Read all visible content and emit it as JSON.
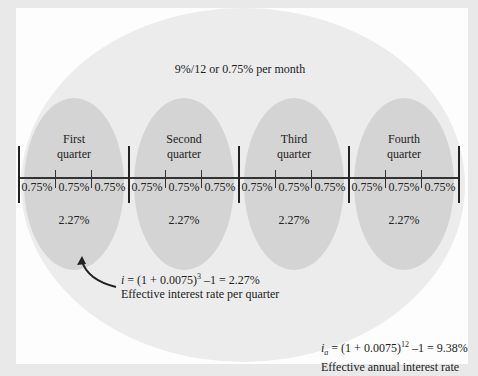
{
  "diagram": {
    "monthly_rate_label": "9%/12 or 0.75% per month",
    "quarters": [
      {
        "label_line1": "First",
        "label_line2": "quarter",
        "months": [
          "0.75%",
          "0.75%",
          "0.75%"
        ],
        "effective": "2.27%"
      },
      {
        "label_line1": "Second",
        "label_line2": "quarter",
        "months": [
          "0.75%",
          "0.75%",
          "0.75%"
        ],
        "effective": "2.27%"
      },
      {
        "label_line1": "Third",
        "label_line2": "quarter",
        "months": [
          "0.75%",
          "0.75%",
          "0.75%"
        ],
        "effective": "2.27%"
      },
      {
        "label_line1": "Fourth",
        "label_line2": "quarter",
        "months": [
          "0.75%",
          "0.75%",
          "0.75%"
        ],
        "effective": "2.27%"
      }
    ],
    "quarter_formula": {
      "var": "i",
      "lhs_pre": " = (1 + 0.0075)",
      "exponent": "3",
      "rhs": " –1 = 2.27%",
      "caption": "Effective interest rate per quarter"
    },
    "annual_formula": {
      "var": "i",
      "subscript": "a",
      "lhs_pre": " = (1 + 0.0075)",
      "exponent": "12",
      "rhs": " –1 = 9.38%",
      "caption": "Effective annual interest rate"
    },
    "colors": {
      "frame": "#e9e9e9",
      "panel": "#fdfdfd",
      "outer_ellipse": "#ececec",
      "quarter_ellipse": "#d4d4d4",
      "lines": "#222222"
    }
  }
}
